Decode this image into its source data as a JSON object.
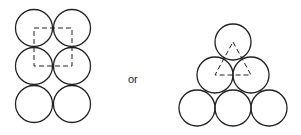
{
  "diagram": {
    "connector_label": "or",
    "stroke_color": "#222222",
    "left_packing": {
      "name": "square packing",
      "radius": 18.5,
      "circles": [
        {
          "cx": 34,
          "cy": 28
        },
        {
          "cx": 72,
          "cy": 28
        },
        {
          "cx": 34,
          "cy": 66
        },
        {
          "cx": 72,
          "cy": 66
        },
        {
          "cx": 34,
          "cy": 104
        },
        {
          "cx": 72,
          "cy": 104
        }
      ],
      "dashed_shape": "square",
      "dashed_points": [
        [
          34,
          28
        ],
        [
          72,
          28
        ],
        [
          72,
          66
        ],
        [
          34,
          66
        ]
      ]
    },
    "right_packing": {
      "name": "triangular packing",
      "radius": 18,
      "circles": [
        {
          "cx": 233,
          "cy": 42
        },
        {
          "cx": 215,
          "cy": 75
        },
        {
          "cx": 251,
          "cy": 75
        },
        {
          "cx": 197,
          "cy": 108
        },
        {
          "cx": 233,
          "cy": 108
        },
        {
          "cx": 269,
          "cy": 108
        }
      ],
      "dashed_shape": "triangle",
      "dashed_points": [
        [
          233,
          42
        ],
        [
          251,
          75
        ],
        [
          215,
          75
        ]
      ]
    }
  }
}
